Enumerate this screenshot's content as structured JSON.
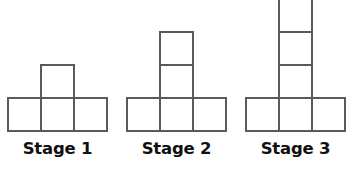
{
  "figure": {
    "background_color": "#ffffff",
    "stroke_color": "#5a5a5a",
    "stroke_width": 2,
    "cell_size": 33,
    "baseline_y": 131,
    "label_y": 141,
    "pattern_description": "Row of 3 squares with a vertical stack of n squares on the middle column",
    "stages": [
      {
        "label": "Stage 1",
        "stage_number": 1,
        "base_row_count": 3,
        "stack_count": 1,
        "total_squares": 4,
        "base_left_x": 8,
        "base_right_x": 107,
        "stack_top_y": 64
      },
      {
        "label": "Stage 2",
        "stage_number": 2,
        "base_row_count": 3,
        "stack_count": 2,
        "total_squares": 5,
        "base_left_x": 127,
        "base_right_x": 226,
        "stack_top_y": 31
      },
      {
        "label": "Stage 3",
        "stage_number": 3,
        "base_row_count": 3,
        "stack_count": 3,
        "total_squares": 6,
        "base_left_x": 246,
        "base_right_x": 345,
        "stack_top_y": 5
      }
    ]
  }
}
